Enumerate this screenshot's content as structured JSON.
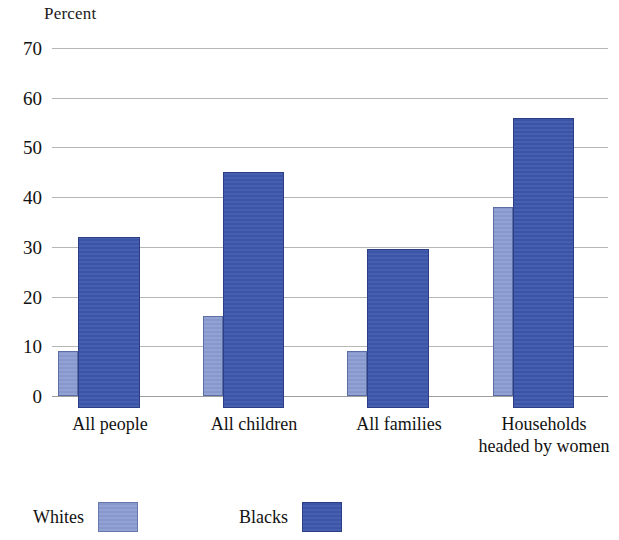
{
  "chart_data": {
    "type": "bar",
    "title": "",
    "ylabel": "Percent",
    "xlabel": "",
    "ylim": [
      0,
      70
    ],
    "ytick_step": 10,
    "yticks": [
      70,
      60,
      50,
      40,
      30,
      20,
      10,
      0
    ],
    "grid": true,
    "legend_position": "bottom-left",
    "categories": [
      "All people",
      "All children",
      "All families",
      "Households\nheaded by women"
    ],
    "category_labels": [
      {
        "line1": "All people",
        "line2": ""
      },
      {
        "line1": "All children",
        "line2": ""
      },
      {
        "line1": "All families",
        "line2": ""
      },
      {
        "line1": "Households",
        "line2": "headed by women"
      }
    ],
    "series": [
      {
        "name": "Whites",
        "color": "#8c9dd2",
        "values": [
          9,
          16,
          9,
          38
        ]
      },
      {
        "name": "Blacks",
        "color": "#3f59ae",
        "values": [
          32,
          45,
          29.5,
          56
        ]
      }
    ]
  },
  "legend": {
    "items": [
      {
        "label": "Whites",
        "swatch": "whites-swatch"
      },
      {
        "label": "Blacks",
        "swatch": "blacks-swatch"
      }
    ]
  },
  "colors": {
    "whites": "#8c9dd2",
    "blacks": "#3f59ae",
    "gridline": "#9a9a9a",
    "text": "#121212",
    "background": "#ffffff"
  },
  "layout": {
    "plot_left": 52,
    "plot_top": 48,
    "plot_width": 556,
    "plot_height": 348,
    "groups": [
      {
        "whites_x": 6,
        "whites_w": 20,
        "blacks_x": 26,
        "blacks_w": 62,
        "label_center": 58
      },
      {
        "whites_x": 151,
        "whites_w": 20,
        "blacks_x": 171,
        "blacks_w": 61,
        "label_center": 202
      },
      {
        "whites_x": 295,
        "whites_w": 20,
        "blacks_x": 315,
        "blacks_w": 62,
        "label_center": 347
      },
      {
        "whites_x": 441,
        "whites_w": 20,
        "blacks_x": 461,
        "blacks_w": 61,
        "label_center": 492
      }
    ],
    "blacks_baseline_overshoot": 12
  }
}
